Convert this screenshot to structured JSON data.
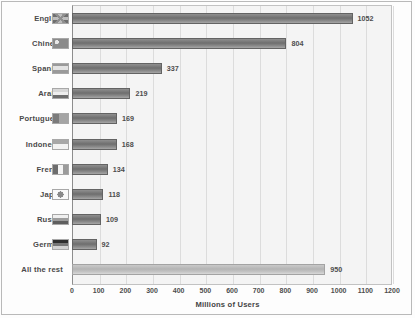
{
  "chart_data": {
    "type": "bar",
    "orientation": "horizontal",
    "title": "",
    "xlabel": "Millions of Users",
    "ylabel": "",
    "xlim": [
      0,
      1200
    ],
    "xticks": [
      0,
      100,
      200,
      300,
      400,
      500,
      600,
      700,
      800,
      900,
      1000,
      1100,
      1200
    ],
    "grid": true,
    "legend": "none",
    "categories": [
      "English",
      "Chinese",
      "Spanish",
      "Arabic",
      "Portuguese",
      "Indonesia",
      "French",
      "Japan",
      "Russia",
      "German",
      "All the rest"
    ],
    "values": [
      1052,
      804,
      337,
      219,
      169,
      168,
      134,
      118,
      109,
      92,
      950
    ],
    "series": [
      {
        "name": "Millions of Users",
        "values": [
          1052,
          804,
          337,
          219,
          169,
          168,
          134,
          118,
          109,
          92,
          950
        ]
      }
    ],
    "bars": [
      {
        "label": "English",
        "value": 1052,
        "value_text": "1052",
        "icon": "flag-english-icon",
        "style": "normal"
      },
      {
        "label": "Chinese",
        "value": 804,
        "value_text": "804",
        "icon": "flag-chinese-icon",
        "style": "normal"
      },
      {
        "label": "Spanish",
        "value": 337,
        "value_text": "337",
        "icon": "flag-spanish-icon",
        "style": "normal"
      },
      {
        "label": "Arabic",
        "value": 219,
        "value_text": "219",
        "icon": "flag-arabic-icon",
        "style": "normal"
      },
      {
        "label": "Portuguese",
        "value": 169,
        "value_text": "169",
        "icon": "flag-portuguese-icon",
        "style": "normal"
      },
      {
        "label": "Indonesia",
        "value": 168,
        "value_text": "168",
        "icon": "flag-indonesia-icon",
        "style": "normal"
      },
      {
        "label": "French",
        "value": 134,
        "value_text": "134",
        "icon": "flag-french-icon",
        "style": "normal"
      },
      {
        "label": "Japan",
        "value": 118,
        "value_text": "118",
        "icon": "flag-japan-icon",
        "style": "normal"
      },
      {
        "label": "Russia",
        "value": 109,
        "value_text": "109",
        "icon": "flag-russia-icon",
        "style": "normal"
      },
      {
        "label": "German",
        "value": 92,
        "value_text": "92",
        "icon": "flag-german-icon",
        "style": "normal"
      },
      {
        "label": "All the rest",
        "value": 950,
        "value_text": "950",
        "icon": "no-flag-icon",
        "style": "light"
      }
    ]
  },
  "colors": {
    "bar": "#6e6e6e",
    "bar_rest": "#b4b4b4",
    "plot_background": "#f4f4f4",
    "gridline": "#dcdcdc",
    "frame": "#b9b9b9",
    "text": "#4a4a4a"
  }
}
